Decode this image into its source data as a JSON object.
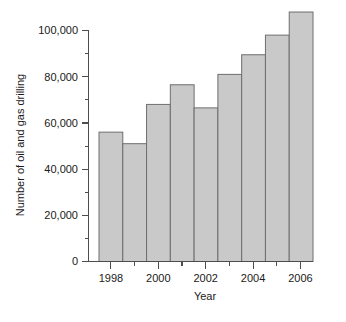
{
  "chart_data": {
    "type": "bar",
    "title": "",
    "xlabel": "Year",
    "ylabel": "Number of oil and gas drilling",
    "categories": [
      "1998",
      "1999",
      "2000",
      "2001",
      "2002",
      "2003",
      "2004",
      "2005",
      "2006"
    ],
    "values": [
      56000,
      51000,
      68000,
      76500,
      66500,
      81000,
      89500,
      98000,
      108000
    ],
    "ylim": [
      0,
      110000
    ],
    "xlim_categories": 9,
    "y_ticks_major": [
      0,
      20000,
      40000,
      60000,
      80000,
      100000
    ],
    "y_ticks_major_labels": [
      "0",
      "20,000",
      "40,000",
      "60,000",
      "80,000",
      "100,000"
    ],
    "y_ticks_minor": [
      10000,
      30000,
      50000,
      70000,
      90000
    ],
    "x_ticks_major_labels": [
      "1998",
      "2000",
      "2002",
      "2004",
      "2006"
    ],
    "x_ticks_minor_labels": [
      "1999",
      "2001",
      "2003",
      "2005"
    ],
    "grid": false,
    "legend": false,
    "legend_position": "none",
    "bar_fill_color": "#c9c9c9",
    "bar_border_color": "#6e6e6e",
    "axis_color": "#4d4d4d"
  },
  "axes": {
    "y_label": "Number of oil and gas drilling",
    "x_label": "Year"
  },
  "y_tick_labels": [
    {
      "text": "0"
    },
    {
      "text": "20,000"
    },
    {
      "text": "40,000"
    },
    {
      "text": "60,000"
    },
    {
      "text": "80,000"
    },
    {
      "text": "100,000"
    }
  ],
  "x_tick_labels": [
    {
      "text": "1998"
    },
    {
      "text": "2000"
    },
    {
      "text": "2002"
    },
    {
      "text": "2004"
    },
    {
      "text": "2006"
    }
  ]
}
